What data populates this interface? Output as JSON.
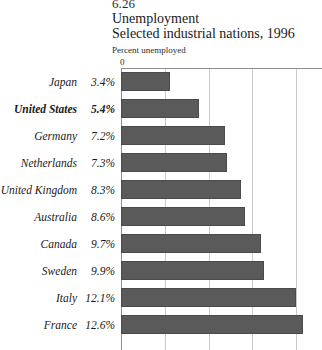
{
  "heading": {
    "figure_number": "6.26",
    "title": "Unemployment",
    "subtitle": "Selected industrial nations, 1996",
    "axis_caption": "Percent unemployed"
  },
  "axis": {
    "zero_tick": "0"
  },
  "colors": {
    "bar_fill": "#5a5a5a",
    "bar_stroke": "#4a4a4a",
    "gridline": "#c9c9c9",
    "axis_line": "#8d8d8d",
    "background": "#ffffff",
    "text": "#1a1a1a"
  },
  "chart_data": {
    "type": "bar",
    "orientation": "horizontal",
    "title": "Unemployment",
    "subtitle": "Selected industrial nations, 1996",
    "figure_number": "6.26",
    "xlabel": "Percent unemployed",
    "ylabel": "",
    "xlim": [
      0,
      13.9
    ],
    "grid": true,
    "gridline_values": [
      3,
      6,
      9,
      12
    ],
    "tick_labels": [
      "0"
    ],
    "legend": null,
    "highlight_category": "United States",
    "categories": [
      "Japan",
      "United States",
      "Germany",
      "Netherlands",
      "United Kingdom",
      "Australia",
      "Canada",
      "Sweden",
      "Italy",
      "France"
    ],
    "values": [
      3.4,
      5.4,
      7.2,
      7.3,
      8.3,
      8.6,
      9.7,
      9.9,
      12.1,
      12.6
    ],
    "value_labels": [
      "3.4%",
      "5.4%",
      "7.2%",
      "7.3%",
      "8.3%",
      "8.6%",
      "9.7%",
      "9.9%",
      "12.1%",
      "12.6%"
    ],
    "rows": [
      {
        "label": "Japan",
        "value": 3.4,
        "value_label": "3.4%",
        "bold": false
      },
      {
        "label": "United States",
        "value": 5.4,
        "value_label": "5.4%",
        "bold": true
      },
      {
        "label": "Germany",
        "value": 7.2,
        "value_label": "7.2%",
        "bold": false
      },
      {
        "label": "Netherlands",
        "value": 7.3,
        "value_label": "7.3%",
        "bold": false
      },
      {
        "label": "United Kingdom",
        "value": 8.3,
        "value_label": "8.3%",
        "bold": false
      },
      {
        "label": "Australia",
        "value": 8.6,
        "value_label": "8.6%",
        "bold": false
      },
      {
        "label": "Canada",
        "value": 9.7,
        "value_label": "9.7%",
        "bold": false
      },
      {
        "label": "Sweden",
        "value": 9.9,
        "value_label": "9.9%",
        "bold": false
      },
      {
        "label": "Italy",
        "value": 12.1,
        "value_label": "12.1%",
        "bold": false
      },
      {
        "label": "France",
        "value": 12.6,
        "value_label": "12.6%",
        "bold": false
      }
    ]
  }
}
